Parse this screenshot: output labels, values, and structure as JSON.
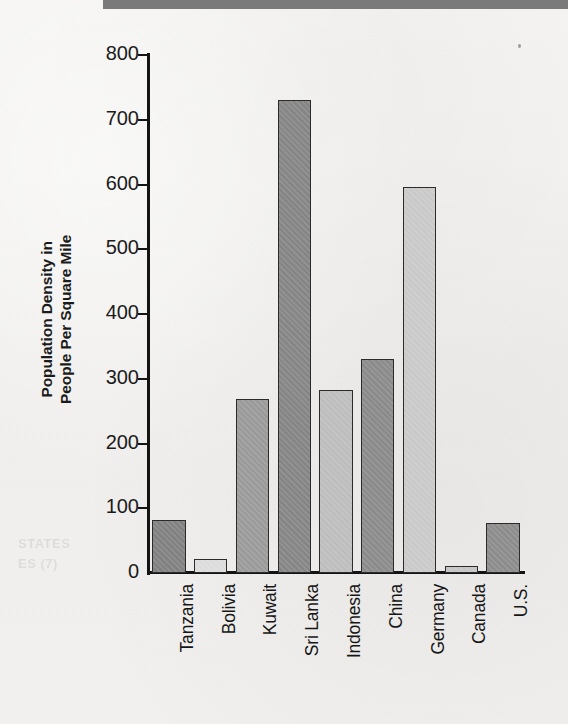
{
  "chart_data": {
    "type": "bar",
    "title": "",
    "xlabel": "",
    "ylabel": "Population Density in People Per Square Mile",
    "ylabel_lines": [
      "Population Density in",
      "People Per Square Mile"
    ],
    "ylim": [
      0,
      800
    ],
    "y_ticks": [
      0,
      100,
      200,
      300,
      400,
      500,
      600,
      700,
      800
    ],
    "y_tick_labels": [
      "0",
      "100",
      "200",
      "300",
      "400",
      "500",
      "600",
      "700",
      "800"
    ],
    "grid": false,
    "legend": "none",
    "categories": [
      "Tanzania",
      "Bolivia",
      "Kuwait",
      "Sri Lanka",
      "Indonesia",
      "China",
      "Germany",
      "Canada",
      "U.S."
    ],
    "values": [
      82,
      22,
      268,
      730,
      282,
      330,
      596,
      11,
      77
    ],
    "bar_colors": [
      "#808080",
      "#dcdcdc",
      "#9a9a9a",
      "#858585",
      "#bdbdbd",
      "#8a8a8a",
      "#c9c9c9",
      "#c4c4c4",
      "#8b8b8b"
    ]
  },
  "page": {
    "background_color": "#f2f1ef",
    "top_band_color": "#7a7a7a",
    "axis_color": "#141414",
    "text_color": "#1b1b1b",
    "ghost_text": {
      "line1": "",
      "line2": "STATES",
      "line3": "ES (7)",
      "line4": "",
      "line5": ""
    }
  }
}
